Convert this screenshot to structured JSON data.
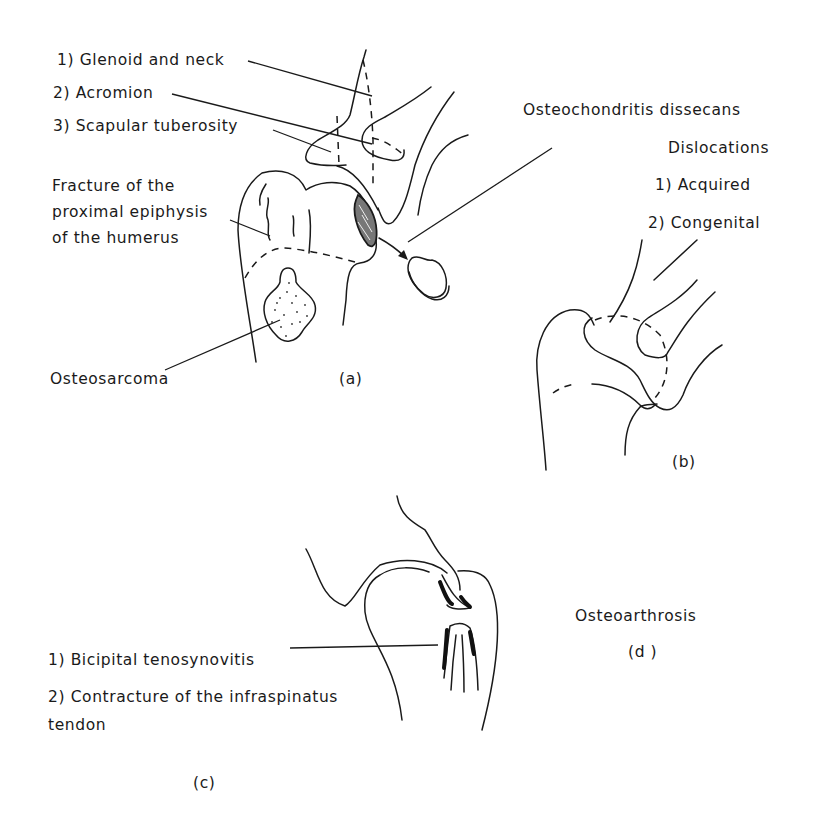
{
  "figure": {
    "panels": [
      {
        "id": "a",
        "caption": "(a)",
        "labels": {
          "glenoid": "1) Glenoid and neck",
          "acromion": "2) Acromion",
          "scapular": "3) Scapular tuberosity",
          "fracture_line1": "Fracture of the",
          "fracture_line2": "proximal epiphysis",
          "fracture_line3": "of the humerus",
          "osteosarcoma": "Osteosarcoma",
          "osteochondritis": "Osteochondritis dissecans"
        }
      },
      {
        "id": "b",
        "caption": "(b)",
        "labels": {
          "title": "Dislocations",
          "acquired": "1) Acquired",
          "congenital": "2) Congenital"
        }
      },
      {
        "id": "c",
        "caption": "(c)",
        "labels": {
          "bicipital": "1) Bicipital tenosynovitis",
          "contracture_line1": "2) Contracture of the infraspinatus",
          "contracture_line2": "tendon"
        }
      },
      {
        "id": "d",
        "caption": "(d )",
        "labels": {
          "title": "Osteoarthrosis"
        }
      }
    ]
  }
}
